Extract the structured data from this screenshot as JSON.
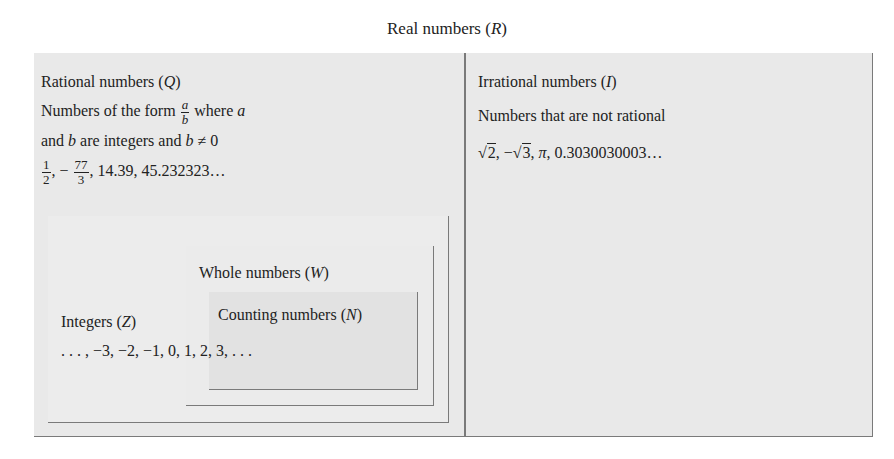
{
  "title": {
    "prefix": "Real numbers (",
    "symbol": "R",
    "suffix": ")"
  },
  "rational": {
    "heading_prefix": "Rational numbers (",
    "heading_symbol": "Q",
    "heading_suffix": ")",
    "desc_line1_prefix": "Numbers of the form ",
    "desc_frac_num": "a",
    "desc_frac_den": "b",
    "desc_line1_mid": " where ",
    "desc_line1_var": "a",
    "desc_line2_prefix": "and ",
    "desc_line2_var": "b",
    "desc_line2_mid": " are integers and ",
    "desc_line2_var2": "b",
    "desc_line2_suffix": " ≠ 0",
    "examples": {
      "frac1_num": "1",
      "frac1_den": "2",
      "sep1": ", − ",
      "frac2_num": "77",
      "frac2_den": "3",
      "rest": ", 14.39, 45.232323…"
    }
  },
  "irrational": {
    "heading_prefix": "Irrational numbers (",
    "heading_symbol": "I",
    "heading_suffix": ")",
    "description": "Numbers that are not rational",
    "examples": {
      "root1": "2",
      "sep1": ", −",
      "root2": "3",
      "sep2": ", ",
      "pi": "π",
      "rest": ", 0.3030030003…"
    }
  },
  "integers": {
    "heading_prefix": "Integers (",
    "heading_symbol": "Z",
    "heading_suffix": ")",
    "examples": ". . . , −3, −2, −1, 0, 1, 2, 3, . . ."
  },
  "whole": {
    "heading_prefix": "Whole numbers (",
    "heading_symbol": "W",
    "heading_suffix": ")"
  },
  "counting": {
    "heading_prefix": "Counting numbers (",
    "heading_symbol": "N",
    "heading_suffix": ")"
  },
  "colors": {
    "background": "#ffffff",
    "panel": "#e9e9e9",
    "counting_box": "#e2e2e2",
    "border": "#7a7a7a",
    "text": "#222222"
  }
}
